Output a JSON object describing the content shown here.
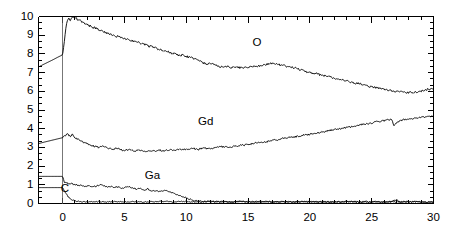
{
  "chart_data": {
    "type": "line",
    "title": "",
    "subtitle": "",
    "xlabel": "",
    "ylabel": "",
    "xlim": [
      -1.95,
      30
    ],
    "ylim": [
      0,
      10
    ],
    "xticks": [
      0,
      5,
      10,
      15,
      20,
      25,
      30
    ],
    "xtick_labels": [
      "0",
      "5",
      "10",
      "15",
      "20",
      "25",
      "30"
    ],
    "yticks": [
      0,
      1,
      2,
      3,
      4,
      5,
      6,
      7,
      8,
      9,
      10
    ],
    "ytick_labels": [
      "0",
      "1",
      "2",
      "3",
      "4",
      "5",
      "6",
      "7",
      "8",
      "9",
      "10"
    ],
    "minor_tick_count_per_interval": 2,
    "grid": false,
    "legend_position": "inline-annotations",
    "frame": "box",
    "line_color": "#000000",
    "line_width": 0.9,
    "series": [
      {
        "name": "O",
        "label": "O",
        "label_x": 16.0,
        "label_y": 8.55,
        "x": [
          -1.95,
          -1.6,
          -1.2,
          -0.8,
          -0.4,
          0.0,
          0.12,
          0.25,
          0.38,
          0.5,
          0.62,
          0.75,
          0.88,
          1.0,
          1.12,
          1.25,
          1.38,
          1.5,
          1.65,
          1.8,
          2.0,
          2.2,
          2.4,
          2.6,
          2.8,
          3.0,
          3.2,
          3.4,
          3.6,
          3.8,
          4.0,
          4.3,
          4.6,
          4.9,
          5.2,
          5.5,
          5.8,
          6.1,
          6.4,
          6.7,
          7.0,
          7.3,
          7.6,
          7.9,
          8.2,
          8.5,
          8.8,
          9.1,
          9.4,
          9.7,
          10.0,
          10.4,
          10.8,
          11.2,
          11.6,
          12.0,
          12.4,
          12.8,
          13.2,
          13.6,
          14.0,
          14.5,
          15.0,
          15.5,
          16.0,
          16.5,
          17.0,
          17.5,
          18.0,
          18.5,
          19.0,
          19.5,
          20.0,
          20.5,
          21.0,
          21.5,
          22.0,
          22.5,
          23.0,
          23.5,
          24.0,
          24.5,
          25.0,
          25.5,
          26.0,
          26.5,
          27.0,
          27.5,
          28.0,
          28.5,
          29.0,
          29.5,
          30.0
        ],
        "y": [
          7.3,
          7.42,
          7.55,
          7.68,
          7.82,
          7.95,
          8.6,
          9.35,
          9.82,
          9.9,
          9.78,
          9.9,
          9.97,
          9.86,
          9.92,
          9.75,
          9.85,
          9.72,
          9.66,
          9.62,
          9.55,
          9.5,
          9.42,
          9.4,
          9.33,
          9.28,
          9.22,
          9.18,
          9.1,
          9.06,
          9.0,
          8.92,
          8.95,
          8.82,
          8.78,
          8.72,
          8.68,
          8.62,
          8.55,
          8.5,
          8.42,
          8.36,
          8.3,
          8.22,
          8.15,
          8.12,
          8.05,
          8.0,
          7.92,
          7.95,
          7.86,
          7.8,
          7.7,
          7.58,
          7.45,
          7.5,
          7.38,
          7.3,
          7.34,
          7.28,
          7.3,
          7.25,
          7.3,
          7.32,
          7.38,
          7.45,
          7.5,
          7.42,
          7.35,
          7.3,
          7.2,
          7.1,
          7.0,
          6.95,
          6.85,
          6.8,
          6.7,
          6.6,
          6.55,
          6.45,
          6.4,
          6.32,
          6.22,
          6.18,
          6.1,
          6.05,
          6.0,
          5.95,
          5.92,
          5.95,
          6.0,
          6.1,
          6.15
        ]
      },
      {
        "name": "Gd",
        "label": "Gd",
        "label_x": 11.6,
        "label_y": 4.32,
        "x": [
          -1.95,
          -1.5,
          -1.0,
          -0.5,
          0.0,
          0.2,
          0.4,
          0.6,
          0.8,
          1.0,
          1.2,
          1.4,
          1.6,
          1.8,
          2.0,
          2.3,
          2.6,
          2.9,
          3.2,
          3.5,
          3.8,
          4.1,
          4.4,
          4.7,
          5.0,
          5.4,
          5.8,
          6.2,
          6.6,
          7.0,
          7.4,
          7.8,
          8.2,
          8.6,
          9.0,
          9.5,
          10.0,
          10.5,
          11.0,
          11.5,
          12.0,
          12.5,
          13.0,
          13.5,
          14.0,
          14.5,
          15.0,
          15.5,
          16.0,
          16.5,
          17.0,
          17.5,
          18.0,
          18.5,
          19.0,
          19.5,
          20.0,
          20.5,
          21.0,
          21.5,
          22.0,
          22.5,
          23.0,
          23.5,
          24.0,
          24.5,
          25.0,
          25.5,
          26.0,
          26.3,
          26.6,
          26.8,
          27.0,
          27.3,
          27.6,
          28.0,
          28.5,
          29.0,
          29.5,
          30.0
        ],
        "y": [
          3.2,
          3.28,
          3.36,
          3.44,
          3.52,
          3.62,
          3.72,
          3.6,
          3.68,
          3.52,
          3.45,
          3.38,
          3.3,
          3.24,
          3.18,
          3.12,
          3.05,
          3.0,
          3.08,
          2.98,
          2.94,
          2.9,
          2.96,
          2.88,
          2.85,
          2.88,
          2.82,
          2.86,
          2.8,
          2.84,
          2.8,
          2.86,
          2.82,
          2.88,
          2.85,
          2.9,
          2.88,
          2.94,
          2.9,
          2.96,
          2.92,
          3.0,
          3.05,
          3.0,
          3.08,
          3.12,
          3.15,
          3.22,
          3.25,
          3.3,
          3.38,
          3.42,
          3.5,
          3.55,
          3.58,
          3.66,
          3.7,
          3.78,
          3.82,
          3.9,
          3.95,
          4.0,
          4.08,
          4.12,
          4.2,
          4.25,
          4.3,
          4.38,
          4.42,
          4.48,
          4.5,
          4.2,
          4.3,
          4.42,
          4.48,
          4.52,
          4.55,
          4.6,
          4.65,
          4.7
        ]
      },
      {
        "name": "Ga",
        "label": "Ga",
        "label_x": 7.3,
        "label_y": 1.42,
        "x": [
          -1.95,
          -1.0,
          -0.3,
          0.0,
          0.15,
          0.3,
          0.5,
          0.7,
          0.9,
          1.1,
          1.3,
          1.5,
          1.8,
          2.1,
          2.4,
          2.7,
          3.0,
          3.3,
          3.6,
          3.9,
          4.2,
          4.5,
          4.8,
          5.1,
          5.4,
          5.7,
          6.0,
          6.3,
          6.6,
          6.9,
          7.2,
          7.5,
          7.8,
          8.1,
          8.4,
          8.7,
          9.0,
          9.3,
          9.6,
          9.9,
          10.2,
          10.5,
          10.8,
          11.1,
          11.5,
          12.0,
          12.5,
          13.0,
          13.5,
          14.0,
          14.5,
          15.0,
          15.5,
          16.0,
          16.5,
          17.0,
          17.5,
          18.0,
          18.5,
          19.0,
          19.5,
          20.0,
          20.5,
          21.0,
          21.5,
          22.0,
          22.5,
          23.0,
          23.5,
          24.0,
          24.5,
          25.0,
          25.5,
          26.0,
          26.5,
          27.0,
          27.3,
          27.6,
          28.0,
          28.5,
          29.0,
          29.5,
          30.0
        ],
        "y": [
          1.45,
          1.45,
          1.45,
          1.45,
          1.12,
          1.1,
          1.05,
          1.08,
          1.0,
          1.02,
          0.95,
          0.98,
          0.93,
          0.95,
          0.9,
          0.92,
          1.0,
          0.95,
          0.88,
          0.92,
          0.86,
          0.9,
          0.82,
          0.86,
          0.9,
          0.82,
          0.78,
          0.8,
          0.72,
          0.78,
          0.66,
          0.7,
          0.62,
          0.68,
          0.72,
          0.6,
          0.55,
          0.48,
          0.4,
          0.32,
          0.25,
          0.18,
          0.14,
          0.12,
          0.1,
          0.1,
          0.09,
          0.12,
          0.08,
          0.1,
          0.12,
          0.09,
          0.1,
          0.08,
          0.11,
          0.09,
          0.08,
          0.1,
          0.09,
          0.11,
          0.08,
          0.1,
          0.09,
          0.08,
          0.1,
          0.09,
          0.08,
          0.1,
          0.09,
          0.08,
          0.1,
          0.09,
          0.1,
          0.08,
          0.09,
          0.2,
          0.05,
          0.1,
          0.08,
          0.09,
          0.07,
          0.08,
          0.07
        ]
      },
      {
        "name": "C",
        "label": "C",
        "label_x": 0.5,
        "label_y": 0.72,
        "x": [
          -1.95,
          -1.0,
          -0.3,
          0.0,
          0.2,
          0.4,
          0.6,
          0.8,
          1.0,
          1.2,
          1.5,
          1.8,
          2.1,
          2.5,
          3.0,
          3.5,
          4.0,
          4.5,
          5.0,
          5.5,
          6.0,
          6.5,
          7.0,
          7.5,
          8.0,
          8.5,
          9.0,
          9.5,
          10.0,
          10.5,
          11.0,
          11.5,
          12.0,
          12.5,
          13.0,
          13.5,
          14.0,
          14.5,
          15.0,
          15.5,
          16.0,
          16.5,
          17.0,
          17.5,
          18.0,
          18.5,
          19.0,
          19.5,
          20.0,
          20.5,
          21.0,
          21.5,
          22.0,
          22.5,
          23.0,
          23.5,
          24.0,
          24.5,
          25.0,
          25.5,
          26.0,
          26.5,
          27.0,
          27.5,
          28.0,
          28.5,
          29.0,
          29.5,
          30.0
        ],
        "y": [
          0.85,
          0.85,
          0.85,
          0.85,
          0.62,
          0.4,
          0.25,
          0.18,
          0.14,
          0.12,
          0.1,
          0.09,
          0.08,
          0.09,
          0.1,
          0.08,
          0.09,
          0.1,
          0.08,
          0.1,
          0.09,
          0.08,
          0.1,
          0.09,
          0.12,
          0.1,
          0.09,
          0.11,
          0.1,
          0.09,
          0.08,
          0.1,
          0.12,
          0.09,
          0.1,
          0.08,
          0.11,
          0.09,
          0.1,
          0.08,
          0.09,
          0.1,
          0.08,
          0.09,
          0.1,
          0.08,
          0.09,
          0.1,
          0.08,
          0.09,
          0.1,
          0.08,
          0.09,
          0.08,
          0.09,
          0.1,
          0.08,
          0.09,
          0.08,
          0.09,
          0.08,
          0.09,
          0.08,
          0.09,
          0.08,
          0.09,
          0.08,
          0.07,
          0.08
        ]
      }
    ]
  }
}
